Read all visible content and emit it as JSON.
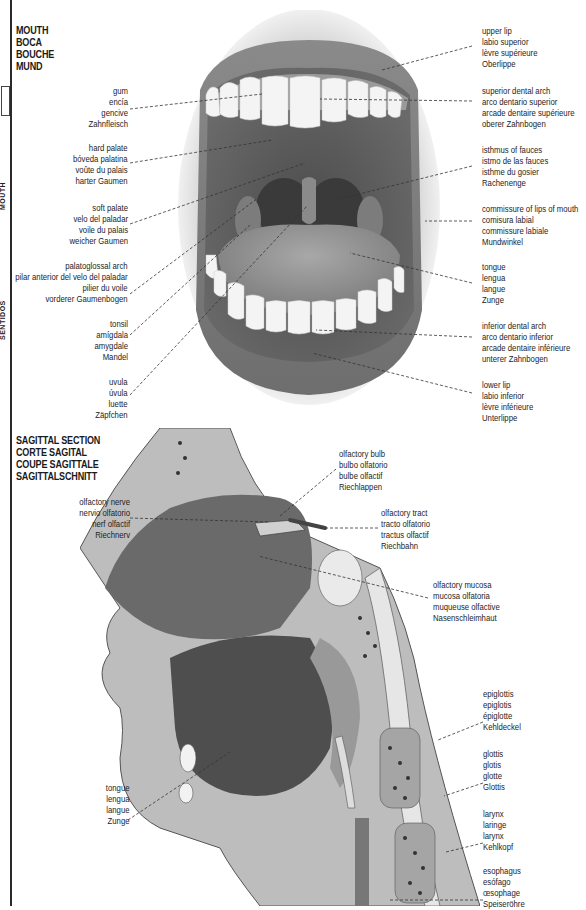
{
  "margin": {
    "side_text_top": "MOUTH",
    "side_text_bottom": "SENTIDOS"
  },
  "mouth": {
    "heading": [
      "MOUTH",
      "BOCA",
      "BOUCHE",
      "MUND"
    ],
    "labels_left": [
      {
        "id": "gum",
        "lines": [
          "gum",
          "encía",
          "gencive",
          "Zahnfleisch"
        ]
      },
      {
        "id": "hard-palate",
        "lines": [
          "hard palate",
          "bóveda palatina",
          "voûte du palais",
          "harter Gaumen"
        ]
      },
      {
        "id": "soft-palate",
        "lines": [
          "soft palate",
          "velo del paladar",
          "voile du palais",
          "weicher Gaumen"
        ]
      },
      {
        "id": "palatoglossal-arch",
        "lines": [
          "palatoglossal arch",
          "pilar anterior del velo del paladar",
          "pilier du voile",
          "vorderer Gaumenbogen"
        ]
      },
      {
        "id": "tonsil",
        "lines": [
          "tonsil",
          "amígdala",
          "amygdale",
          "Mandel"
        ]
      },
      {
        "id": "uvula",
        "lines": [
          "uvula",
          "úvula",
          "luette",
          "Zäpfchen"
        ]
      }
    ],
    "labels_right": [
      {
        "id": "upper-lip",
        "lines": [
          "upper lip",
          "labio superior",
          "lèvre supérieure",
          "Oberlippe"
        ]
      },
      {
        "id": "superior-dental-arch",
        "lines": [
          "superior dental arch",
          "arco dentario superior",
          "arcade dentaire supérieure",
          "oberer Zahnbogen"
        ]
      },
      {
        "id": "isthmus-of-fauces",
        "lines": [
          "isthmus of fauces",
          "istmo de las fauces",
          "isthme du gosier",
          "Rachenenge"
        ]
      },
      {
        "id": "commissure-of-lips",
        "lines": [
          "commissure of lips of mouth",
          "comisura labial",
          "commissure labiale",
          "Mundwinkel"
        ]
      },
      {
        "id": "tongue",
        "lines": [
          "tongue",
          "lengua",
          "langue",
          "Zunge"
        ]
      },
      {
        "id": "inferior-dental-arch",
        "lines": [
          "inferior dental arch",
          "arco dentario inferior",
          "arcade dentaire inférieure",
          "unterer Zahnbogen"
        ]
      },
      {
        "id": "lower-lip",
        "lines": [
          "lower lip",
          "labio inferior",
          "lèvre inférieure",
          "Unterlippe"
        ]
      }
    ]
  },
  "sagittal": {
    "heading": [
      "SAGITTAL SECTION",
      "CORTE SAGITAL",
      "COUPE SAGITTALE",
      "SAGITTALSCHNITT"
    ],
    "labels_left": [
      {
        "id": "olfactory-nerve",
        "lines": [
          "olfactory nerve",
          "nervio olfatorio",
          "nerf olfactif",
          "Riechnerv"
        ]
      },
      {
        "id": "tongue",
        "lines": [
          "tongue",
          "lengua",
          "langue",
          "Zunge"
        ]
      }
    ],
    "labels_right": [
      {
        "id": "olfactory-bulb",
        "lines": [
          "olfactory bulb",
          "bulbo olfatorio",
          "bulbe olfactif",
          "Riechlappen"
        ]
      },
      {
        "id": "olfactory-tract",
        "lines": [
          "olfactory tract",
          "tracto olfatorio",
          "tractus olfactif",
          "Riechbahn"
        ]
      },
      {
        "id": "olfactory-mucosa",
        "lines": [
          "olfactory mucosa",
          "mucosa olfatoria",
          "muqueuse olfactive",
          "Nasenschleimhaut"
        ]
      },
      {
        "id": "epiglottis",
        "lines": [
          "epiglottis",
          "epiglotis",
          "épiglotte",
          "Kehldeckel"
        ]
      },
      {
        "id": "glottis",
        "lines": [
          "glottis",
          "glotis",
          "glotte",
          "Glottis"
        ]
      },
      {
        "id": "larynx",
        "lines": [
          "larynx",
          "laringe",
          "larynx",
          "Kehlkopf"
        ]
      },
      {
        "id": "esophagus",
        "lines": [
          "esophagus",
          "esófago",
          "œsophage",
          "Speiseröhre"
        ]
      }
    ]
  }
}
